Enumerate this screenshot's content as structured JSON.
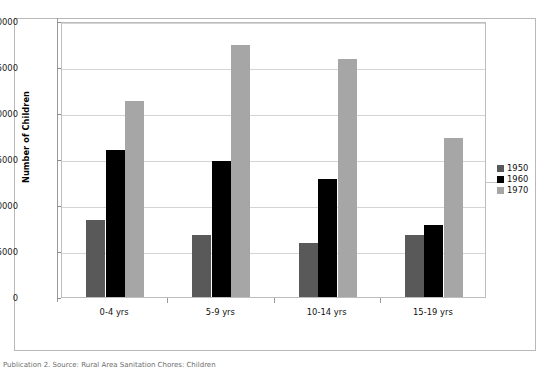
{
  "figure": {
    "caption": "Publication 2. Source: Rural Area Sanitation Chores: Children"
  },
  "axes": {
    "y_title": "Number of Children",
    "y_ticks": [
      "0",
      "5000",
      "10000",
      "15000",
      "20000",
      "25000",
      "30000"
    ],
    "x_categories": [
      "0-4 yrs",
      "5-9 yrs",
      "10-14 yrs",
      "15-19 yrs"
    ]
  },
  "legend": {
    "entries": [
      {
        "label": "1950",
        "color": "#595959"
      },
      {
        "label": "1960",
        "color": "#000000"
      },
      {
        "label": "1970",
        "color": "#A6A6A6"
      }
    ]
  },
  "chart_data": {
    "type": "bar",
    "title": "",
    "subtitle": "",
    "xlabel": "",
    "ylabel": "Number of Children",
    "categories": [
      "0-4 yrs",
      "5-9 yrs",
      "10-14 yrs",
      "15-19 yrs"
    ],
    "series": [
      {
        "name": "1950",
        "color": "#595959",
        "values": [
          8600,
          7000,
          6100,
          7000
        ]
      },
      {
        "name": "1960",
        "color": "#000000",
        "values": [
          16200,
          15000,
          13000,
          8000
        ]
      },
      {
        "name": "1970",
        "color": "#A6A6A6",
        "values": [
          21500,
          27600,
          26100,
          17500
        ]
      }
    ],
    "ylim": [
      0,
      30000
    ],
    "ytick_step": 5000,
    "grid": true,
    "legend_position": "right",
    "annotations": []
  }
}
